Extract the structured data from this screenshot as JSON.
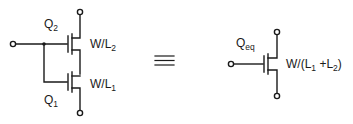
{
  "diagram": {
    "colors": {
      "stroke": "#1a1a1a",
      "background": "#ffffff"
    },
    "left": {
      "top_transistor": {
        "name": "Q",
        "name_sub": "2",
        "size": "W/L",
        "size_sub": "2"
      },
      "bottom_transistor": {
        "name": "Q",
        "name_sub": "1",
        "size": "W/L",
        "size_sub": "1"
      }
    },
    "equivalence_symbol": "≡",
    "right": {
      "transistor": {
        "name": "Q",
        "name_sub": "eq",
        "size_prefix": "W/(L",
        "size_sub1": "1",
        "size_mid": " +L",
        "size_sub2": "2",
        "size_suffix": ")"
      }
    }
  }
}
